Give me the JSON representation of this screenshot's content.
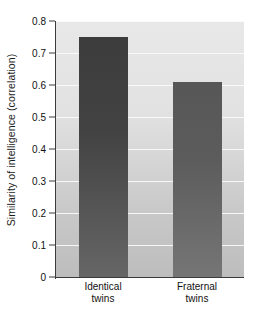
{
  "chart_data": {
    "type": "bar",
    "title": "",
    "xlabel": "",
    "ylabel": "Similarity of intelligence (correlation)",
    "categories": [
      "Identical twins",
      "Fraternal twins"
    ],
    "category_lines": [
      [
        "Identical",
        "twins"
      ],
      [
        "Fraternal",
        "twins"
      ]
    ],
    "values": [
      0.75,
      0.61
    ],
    "ylim": [
      0,
      0.8
    ],
    "yticks": [
      0,
      0.1,
      0.2,
      0.3,
      0.4,
      0.5,
      0.6,
      0.7,
      0.8
    ],
    "ytick_labels": [
      "0",
      "0.1",
      "0.2",
      "0.3",
      "0.4",
      "0.5",
      "0.6",
      "0.7",
      "0.8"
    ],
    "grid": true,
    "legend": "none",
    "bar_colors": [
      "#3c3c3c",
      "#575757"
    ],
    "plot_background": "#e2e2e2",
    "gridline_color": "#fbfbfb",
    "axis_color": "#3b3b3b"
  }
}
